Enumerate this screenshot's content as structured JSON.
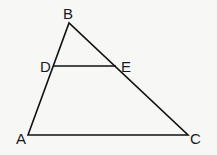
{
  "diagram": {
    "type": "triangle",
    "labels": {
      "A": "A",
      "B": "B",
      "C": "C",
      "D": "D",
      "E": "E"
    },
    "points": {
      "A": [
        28,
        135
      ],
      "B": [
        69,
        23
      ],
      "C": [
        188,
        135
      ],
      "D": [
        53,
        66
      ],
      "E": [
        116,
        66
      ]
    },
    "segments": [
      "AB",
      "BC",
      "CA",
      "DE"
    ],
    "colors": {
      "line": "#111111",
      "background": "#f7f7f5"
    }
  }
}
